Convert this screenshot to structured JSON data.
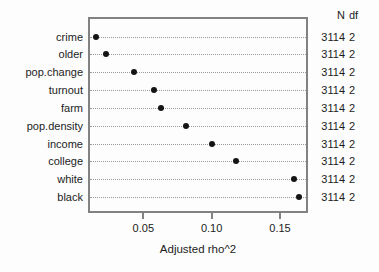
{
  "figure": {
    "background": "#fdfdfd",
    "box_border_color": "#828282",
    "dot_color": "#141414",
    "guide_line_color": "#9a9a9a",
    "text_color": "#1c1c1c"
  },
  "right_table": {
    "header_n": "N",
    "header_df": "df"
  },
  "chart_data": {
    "type": "scatter",
    "variant": "cleveland-dot-plot",
    "orientation": "horizontal",
    "title": "",
    "xlabel": "Adjusted rho^2",
    "categories": [
      "crime",
      "older",
      "pop.change",
      "turnout",
      "farm",
      "pop.density",
      "income",
      "college",
      "white",
      "black"
    ],
    "values": [
      0.015,
      0.023,
      0.043,
      0.058,
      0.063,
      0.081,
      0.1,
      0.118,
      0.16,
      0.164
    ],
    "N": [
      "3114",
      "3114",
      "3114",
      "3114",
      "3114",
      "3114",
      "3114",
      "3114",
      "3114",
      "3114"
    ],
    "df": [
      "2",
      "2",
      "2",
      "2",
      "2",
      "2",
      "2",
      "2",
      "2",
      "2"
    ],
    "xlim": [
      0.0095,
      0.1705
    ],
    "xticks": [
      0.05,
      0.1,
      0.15
    ],
    "xtick_labels": [
      "0.05",
      "0.10",
      "0.15"
    ],
    "grid": "horizontal dotted guides per category",
    "legend": "none"
  }
}
